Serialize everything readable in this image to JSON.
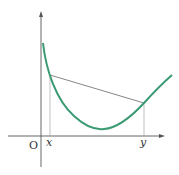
{
  "diagram": {
    "origin_label": "O",
    "x_point_label": "x",
    "y_point_label": "y",
    "colors": {
      "curve": "#3a9a72",
      "axes": "#555555",
      "chord": "#666666",
      "guides": "#999999",
      "text": "#333333"
    }
  }
}
